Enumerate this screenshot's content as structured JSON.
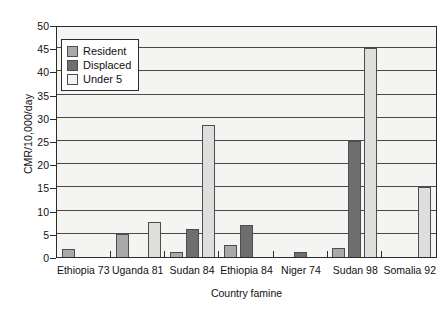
{
  "chart_data": {
    "type": "bar",
    "title": "",
    "xlabel": "Country famine",
    "ylabel": "CMR/10,000/day",
    "ylim": [
      0,
      50
    ],
    "yticks": [
      0,
      5,
      10,
      15,
      20,
      25,
      30,
      35,
      40,
      45,
      50
    ],
    "grid": true,
    "legend_position": "top-left-inside",
    "categories": [
      "Ethiopia 73",
      "Uganda 81",
      "Sudan 84",
      "Ethiopia 84",
      "Niger 74",
      "Sudan 98",
      "Somalia 92"
    ],
    "series": [
      {
        "name": "Resident",
        "color": "#a9a9a9",
        "values": [
          1.7,
          5.0,
          1.0,
          2.5,
          0,
          2.0,
          0
        ]
      },
      {
        "name": "Displaced",
        "color": "#6e6e6e",
        "values": [
          0,
          0,
          6.0,
          7.0,
          1.0,
          25.0,
          0
        ]
      },
      {
        "name": "Under 5",
        "color": "#dededc",
        "values": [
          0,
          7.5,
          28.5,
          0,
          0,
          45.0,
          15.0
        ]
      }
    ]
  },
  "legend": {
    "items": [
      {
        "label": "Resident"
      },
      {
        "label": "Displaced"
      },
      {
        "label": "Under 5"
      }
    ]
  },
  "axis": {
    "y_title": "CMR/10,000/day",
    "x_title": "Country famine",
    "y_tick_labels": [
      "50",
      "45",
      "40",
      "35",
      "30",
      "25",
      "20",
      "15",
      "10",
      "5",
      "0"
    ]
  }
}
